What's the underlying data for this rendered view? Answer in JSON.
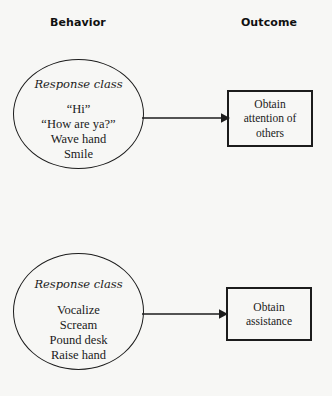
{
  "headers": {
    "behavior": "Behavior",
    "outcome": "Outcome"
  },
  "groups": [
    {
      "circle": {
        "title": "Response class",
        "items": "“Hi”\n“How are ya?”\nWave hand\nSmile",
        "item_list": [
          "“Hi”",
          "“How are ya?”",
          "Wave hand",
          "Smile"
        ]
      },
      "arrow": "arrow-right",
      "outcome": "Obtain attention of others"
    },
    {
      "circle": {
        "title": "Response class",
        "items": "Vocalize\nScream\nPound desk\nRaise hand",
        "item_list": [
          "Vocalize",
          "Scream",
          "Pound desk",
          "Raise hand"
        ]
      },
      "arrow": "arrow-right",
      "outcome": "Obtain assistance"
    }
  ],
  "colors": {
    "background": "#f7f7f5",
    "stroke": "#1c1c1c",
    "text": "#1a1a1a"
  }
}
